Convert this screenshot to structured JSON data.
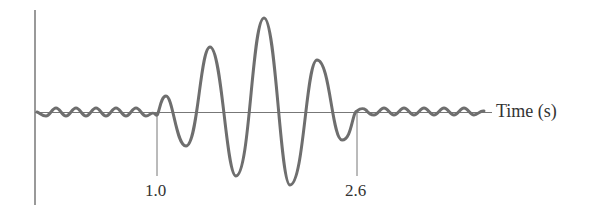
{
  "figure": {
    "type": "waveform-sketch",
    "axis_label_x": "Time (s)",
    "ticks": [
      {
        "label": "1.0",
        "value": 1.0
      },
      {
        "label": "2.6",
        "value": 2.6
      }
    ],
    "colors": {
      "axis": "#555555",
      "wave": "#6e6e6e",
      "text": "#333333"
    }
  }
}
